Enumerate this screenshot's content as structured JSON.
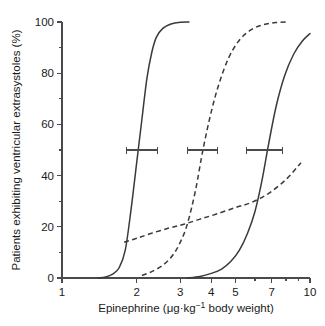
{
  "chart_data": {
    "type": "line",
    "title": "",
    "xlabel": "Epinephrine (μg·kg⁻¹ body weight)",
    "ylabel": "Patients exhibiting ventricular extrasystoles (%)",
    "xscale": "log",
    "xlim": [
      1,
      10
    ],
    "ylim": [
      0,
      100
    ],
    "grid": false,
    "legend": "none",
    "xticks": [
      1,
      2,
      3,
      4,
      5,
      7,
      10
    ],
    "xticklabels": [
      "1",
      "2",
      "3",
      "4",
      "5",
      "7",
      "10"
    ],
    "yticks": [
      0,
      20,
      40,
      60,
      80,
      100
    ],
    "yticklabels": [
      "0",
      "20",
      "40",
      "60",
      "80",
      "100"
    ],
    "yminorticks": [
      10,
      30,
      50,
      70,
      90
    ],
    "series": [
      {
        "name": "curve-1-solid",
        "style": "solid",
        "ed50": 2.1,
        "x": [
          1.4,
          1.5,
          1.6,
          1.7,
          1.8,
          1.9,
          2.0,
          2.1,
          2.2,
          2.3,
          2.4,
          2.55,
          2.75,
          3.0,
          3.25
        ],
        "y": [
          0.0,
          0.4,
          1.5,
          4.0,
          11.0,
          27.0,
          45.0,
          62.0,
          78.0,
          88.0,
          94.0,
          97.5,
          99.2,
          99.9,
          100.0
        ]
      },
      {
        "name": "curve-2-dashed",
        "style": "dashed",
        "ed50": 3.7,
        "x": [
          2.1,
          2.3,
          2.55,
          2.8,
          3.0,
          3.2,
          3.45,
          3.7,
          4.0,
          4.3,
          4.7,
          5.2,
          5.8,
          6.5,
          7.3,
          8.2
        ],
        "y": [
          1.0,
          2.5,
          5.0,
          9.0,
          14.0,
          21.0,
          34.0,
          50.0,
          65.0,
          76.0,
          86.0,
          93.0,
          97.0,
          99.0,
          99.8,
          100.0
        ]
      },
      {
        "name": "curve-3-solid",
        "style": "solid",
        "ed50": 6.6,
        "x": [
          3.2,
          3.6,
          4.0,
          4.4,
          4.8,
          5.2,
          5.6,
          6.0,
          6.4,
          6.8,
          7.3,
          7.9,
          8.6,
          9.3,
          10.0
        ],
        "y": [
          0.0,
          0.6,
          1.8,
          3.5,
          6.5,
          11.0,
          17.5,
          26.0,
          38.0,
          52.0,
          67.0,
          79.0,
          87.5,
          92.5,
          95.5
        ]
      },
      {
        "name": "curve-4-dashed-shallow",
        "style": "dashed",
        "x": [
          1.78,
          2.0,
          2.3,
          2.7,
          3.1,
          3.6,
          4.2,
          5.0,
          5.8,
          6.8,
          8.0,
          9.2
        ],
        "y": [
          14.0,
          15.5,
          17.5,
          19.5,
          21.0,
          23.0,
          25.0,
          27.5,
          29.5,
          33.0,
          38.5,
          45.0
        ]
      }
    ],
    "errorbars": [
      {
        "name": "errorbar-1",
        "y": 50,
        "center": 2.1,
        "low": 1.82,
        "high": 2.42
      },
      {
        "name": "errorbar-2",
        "y": 50,
        "center": 3.7,
        "low": 3.22,
        "high": 4.22
      },
      {
        "name": "errorbar-3",
        "y": 50,
        "center": 6.6,
        "low": 5.55,
        "high": 7.75
      }
    ]
  }
}
